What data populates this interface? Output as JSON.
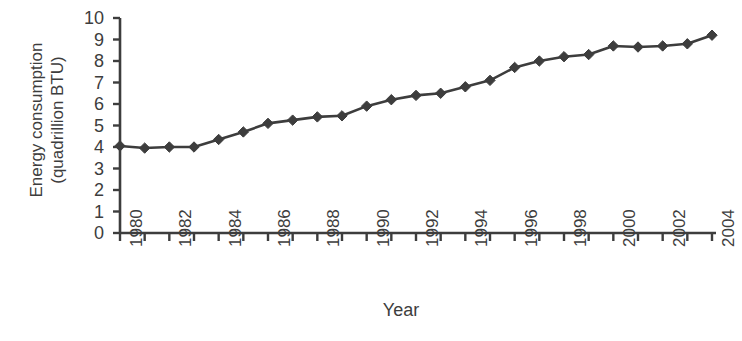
{
  "chart_data": {
    "type": "line",
    "title": "",
    "xlabel": "Year",
    "ylabel": "Energy consumption\n(quadrillion BTU)",
    "ylabel_lines": [
      "Energy consumption",
      "(quadrillion BTU)"
    ],
    "xlim": [
      1980,
      2004
    ],
    "ylim": [
      0,
      10
    ],
    "ytick_step": 1,
    "xtick_step": 1,
    "xtick_label_step": 2,
    "grid": false,
    "legend": null,
    "marker": "diamond",
    "series_color": "#3d3d3d",
    "axis_color": "#3d3d3d",
    "x": [
      1980,
      1981,
      1982,
      1983,
      1984,
      1985,
      1986,
      1987,
      1988,
      1989,
      1990,
      1991,
      1992,
      1993,
      1994,
      1995,
      1996,
      1997,
      1998,
      1999,
      2000,
      2001,
      2002,
      2003,
      2004
    ],
    "y": [
      4.05,
      3.95,
      4.0,
      4.0,
      4.35,
      4.7,
      5.1,
      5.25,
      5.4,
      5.45,
      5.9,
      6.2,
      6.4,
      6.5,
      6.8,
      7.1,
      7.7,
      8.0,
      8.2,
      8.3,
      8.7,
      8.65,
      8.7,
      8.8,
      9.2
    ],
    "ytick_labels": [
      "0",
      "1",
      "2",
      "3",
      "4",
      "5",
      "6",
      "7",
      "8",
      "9",
      "10"
    ],
    "xtick_labels": [
      "1980",
      "1982",
      "1984",
      "1986",
      "1988",
      "1990",
      "1992",
      "1994",
      "1996",
      "1998",
      "2000",
      "2002",
      "2004"
    ]
  }
}
